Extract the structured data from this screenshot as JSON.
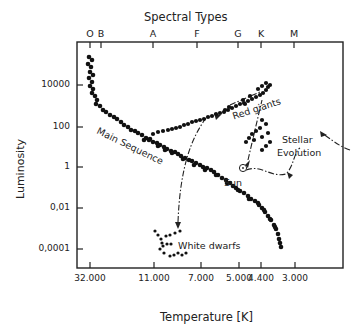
{
  "chart_data": {
    "type": "scatter",
    "top_axis": {
      "label": "Spectral Types",
      "ticks": [
        {
          "label": "O",
          "x": 90
        },
        {
          "label": "B",
          "x": 101
        },
        {
          "label": "A",
          "x": 153
        },
        {
          "label": "F",
          "x": 197
        },
        {
          "label": "G",
          "x": 238
        },
        {
          "label": "K",
          "x": 261
        },
        {
          "label": "M",
          "x": 294
        }
      ]
    },
    "xlabel": "Temperature [K]",
    "x_ticks": [
      {
        "label": "32.000",
        "x": 90
      },
      {
        "label": "11.000",
        "x": 154
      },
      {
        "label": "7.000",
        "x": 201
      },
      {
        "label": "5.000",
        "x": 239
      },
      {
        "label": "4.400",
        "x": 261
      },
      {
        "label": "3.000",
        "x": 295
      }
    ],
    "ylabel": "Luminosity",
    "y_scale": "log",
    "y_ticks": [
      {
        "label": "10000",
        "y": 85
      },
      {
        "label": "100",
        "y": 127
      },
      {
        "label": "1",
        "y": 167
      },
      {
        "label": "0,01",
        "y": 208
      },
      {
        "label": "0,0001",
        "y": 249
      }
    ],
    "grid": false,
    "series": [
      {
        "name": "Main Sequence",
        "points": [
          [
            89,
            57
          ],
          [
            92,
            60
          ],
          [
            88,
            64
          ],
          [
            91,
            67
          ],
          [
            90,
            72
          ],
          [
            93,
            75
          ],
          [
            89,
            78
          ],
          [
            92,
            82
          ],
          [
            90,
            86
          ],
          [
            93,
            89
          ],
          [
            92,
            93
          ],
          [
            95,
            96
          ],
          [
            97,
            100
          ],
          [
            96,
            104
          ],
          [
            100,
            106
          ],
          [
            103,
            110
          ],
          [
            106,
            112
          ],
          [
            110,
            115
          ],
          [
            114,
            117
          ],
          [
            117,
            119
          ],
          [
            121,
            122
          ],
          [
            124,
            125
          ],
          [
            128,
            127
          ],
          [
            131,
            130
          ],
          [
            135,
            131
          ],
          [
            138,
            133
          ],
          [
            142,
            135
          ],
          [
            146,
            138
          ],
          [
            149,
            140
          ],
          [
            153,
            142
          ],
          [
            157,
            143
          ],
          [
            160,
            145
          ],
          [
            164,
            147
          ],
          [
            167,
            149
          ],
          [
            171,
            151
          ],
          [
            175,
            152
          ],
          [
            178,
            154
          ],
          [
            181,
            156
          ],
          [
            185,
            158
          ],
          [
            189,
            160
          ],
          [
            192,
            161
          ],
          [
            196,
            163
          ],
          [
            200,
            165
          ],
          [
            203,
            167
          ],
          [
            207,
            168
          ],
          [
            211,
            170
          ],
          [
            214,
            172
          ],
          [
            218,
            175
          ],
          [
            222,
            178
          ],
          [
            226,
            180
          ],
          [
            230,
            183
          ],
          [
            233,
            186
          ],
          [
            236,
            188
          ],
          [
            240,
            191
          ],
          [
            244,
            193
          ],
          [
            248,
            196
          ],
          [
            251,
            199
          ],
          [
            255,
            201
          ],
          [
            259,
            205
          ],
          [
            262,
            208
          ],
          [
            265,
            212
          ],
          [
            268,
            216
          ],
          [
            271,
            220
          ],
          [
            274,
            225
          ],
          [
            276,
            229
          ],
          [
            278,
            234
          ],
          [
            279,
            239
          ],
          [
            280,
            243
          ],
          [
            281,
            247
          ],
          [
            144,
            140
          ],
          [
            150,
            139
          ],
          [
            158,
            146
          ],
          [
            165,
            150
          ],
          [
            172,
            153
          ],
          [
            183,
            159
          ],
          [
            194,
            165
          ],
          [
            205,
            170
          ],
          [
            216,
            175
          ],
          [
            227,
            183
          ],
          [
            238,
            190
          ],
          [
            249,
            199
          ],
          [
            258,
            203
          ],
          [
            264,
            210
          ],
          [
            270,
            219
          ],
          [
            275,
            227
          ]
        ]
      },
      {
        "name": "Red giants",
        "points": [
          [
            153,
            134
          ],
          [
            158,
            132
          ],
          [
            163,
            131
          ],
          [
            168,
            130
          ],
          [
            172,
            129
          ],
          [
            176,
            128
          ],
          [
            180,
            127
          ],
          [
            184,
            125
          ],
          [
            188,
            124
          ],
          [
            192,
            122
          ],
          [
            196,
            121
          ],
          [
            200,
            120
          ],
          [
            204,
            119
          ],
          [
            208,
            117
          ],
          [
            212,
            116
          ],
          [
            216,
            114
          ],
          [
            220,
            113
          ],
          [
            224,
            112
          ],
          [
            228,
            110
          ],
          [
            232,
            108
          ],
          [
            236,
            106
          ],
          [
            240,
            104
          ],
          [
            244,
            103
          ],
          [
            248,
            101
          ],
          [
            252,
            99
          ],
          [
            256,
            97
          ],
          [
            260,
            95
          ],
          [
            263,
            93
          ],
          [
            266,
            90
          ],
          [
            268,
            87
          ],
          [
            270,
            85
          ],
          [
            266,
            83
          ],
          [
            262,
            86
          ],
          [
            258,
            89
          ],
          [
            250,
            96
          ],
          [
            243,
            100
          ],
          [
            229,
            107
          ],
          [
            225,
            110
          ],
          [
            245,
            104
          ],
          [
            262,
            120
          ],
          [
            266,
            124
          ],
          [
            260,
            128
          ],
          [
            256,
            131
          ],
          [
            252,
            134
          ],
          [
            249,
            138
          ],
          [
            246,
            142
          ],
          [
            254,
            140
          ],
          [
            262,
            137
          ],
          [
            268,
            133
          ],
          [
            270,
            142
          ],
          [
            266,
            146
          ],
          [
            262,
            150
          ]
        ]
      },
      {
        "name": "White dwarfs",
        "points": [
          [
            155,
            231
          ],
          [
            158,
            235
          ],
          [
            161,
            239
          ],
          [
            162,
            243
          ],
          [
            163,
            246
          ],
          [
            160,
            249
          ],
          [
            166,
            236
          ],
          [
            170,
            235
          ],
          [
            175,
            233
          ],
          [
            180,
            231
          ],
          [
            164,
            253
          ],
          [
            170,
            256
          ],
          [
            174,
            255
          ],
          [
            178,
            253
          ],
          [
            182,
            255
          ],
          [
            186,
            253
          ],
          [
            171,
            244
          ],
          [
            167,
            244
          ]
        ]
      }
    ],
    "annotations": [
      {
        "text": "Main Sequence",
        "x": 100,
        "y": 125,
        "rotation": 26
      },
      {
        "text": "Red giants",
        "x": 231,
        "y": 111,
        "rotation": -18
      },
      {
        "text": "White dwarfs",
        "x": 178,
        "y": 240
      },
      {
        "text": "Sun",
        "x": 224,
        "y": 177
      },
      {
        "text": "Stellar",
        "x": 282,
        "y": 134
      },
      {
        "text": "Evolution",
        "x": 277,
        "y": 147
      }
    ],
    "sun_marker": {
      "x": 243,
      "y": 168
    },
    "xlim_px": [
      77,
      343
    ],
    "ylim_px": [
      42,
      268
    ]
  }
}
